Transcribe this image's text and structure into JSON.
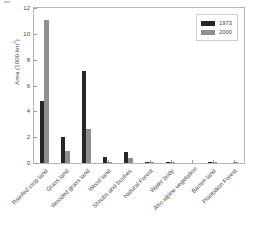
{
  "chart_data": {
    "type": "bar",
    "title": "",
    "subtitle": "",
    "xlabel": "",
    "ylabel": "Area (1000 km2)",
    "ylabel_base": "Area (1000 km",
    "ylabel_sup": "2",
    "ylabel_close": ")",
    "ylim": [
      0,
      12
    ],
    "yticks": [
      0,
      2,
      4,
      6,
      8,
      10,
      12
    ],
    "ytick_labels": [
      "0",
      "2",
      "4",
      "6",
      "8",
      "10",
      "12"
    ],
    "grid": false,
    "legend_position": "top-right",
    "categories": [
      "Rainfed crop land",
      "Grass land",
      "Wooded grass land",
      "Wood land",
      "Shrubs and bushes",
      "Natural Forest",
      "Water body",
      "Afro alpine vegetation",
      "Barren land",
      "Plantation Forest"
    ],
    "series": [
      {
        "name": "1973",
        "color": "#272727",
        "values": [
          4.8,
          2.0,
          7.1,
          0.5,
          0.85,
          0.03,
          0.01,
          0.0,
          0.08,
          0.0
        ]
      },
      {
        "name": "2000",
        "color": "#8e8e8e",
        "values": [
          11.05,
          0.95,
          2.6,
          0.1,
          0.4,
          0.02,
          0.01,
          0.0,
          0.1,
          0.02
        ]
      }
    ]
  },
  "legend": {
    "entries": [
      {
        "label": "1973"
      },
      {
        "label": "2000"
      }
    ]
  }
}
